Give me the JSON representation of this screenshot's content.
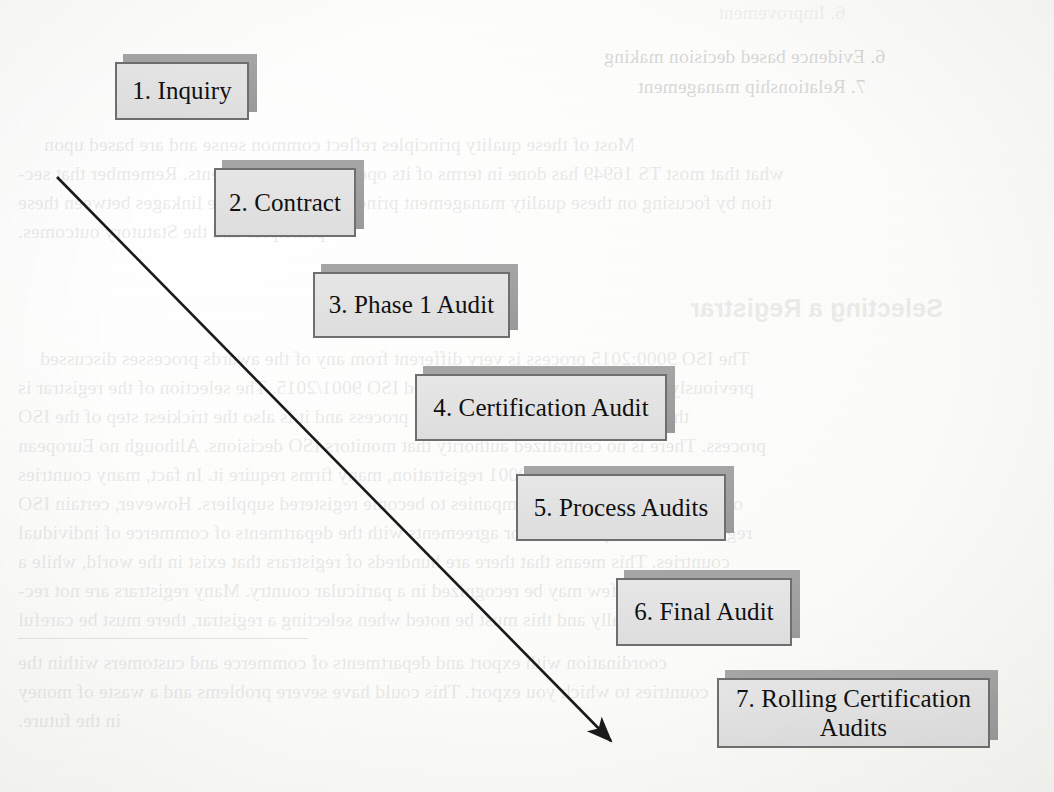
{
  "page": {
    "kind": "scanned-book-page-diagram",
    "background_color": "#fdfdfb",
    "box_fill": "#e3e3e3",
    "box_border": "#6f6f6f",
    "box_shadow": "#9b9b9b",
    "arrow_color": "#1a1a1a"
  },
  "diagram": {
    "title": "",
    "arrow": {
      "start": {
        "x": 57,
        "y": 177
      },
      "end": {
        "x": 617,
        "y": 747
      },
      "label": "flow-arrow"
    },
    "steps": [
      {
        "num": "1",
        "label": "1. Inquiry",
        "x": 115,
        "y": 62,
        "w": 134,
        "h": 58,
        "font": 25
      },
      {
        "num": "2",
        "label": "2. Contract",
        "x": 214,
        "y": 168,
        "w": 142,
        "h": 69,
        "font": 25
      },
      {
        "num": "3",
        "label": "3. Phase 1 Audit",
        "x": 313,
        "y": 272,
        "w": 197,
        "h": 66,
        "font": 25
      },
      {
        "num": "4",
        "label": "4. Certification Audit",
        "x": 415,
        "y": 374,
        "w": 252,
        "h": 67,
        "font": 25
      },
      {
        "num": "5",
        "label": "5. Process Audits",
        "x": 516,
        "y": 474,
        "w": 210,
        "h": 67,
        "font": 25
      },
      {
        "num": "6",
        "label": "6. Final Audit",
        "x": 616,
        "y": 578,
        "w": 176,
        "h": 68,
        "font": 25
      },
      {
        "num": "7",
        "label": "7. Rolling Certification\nAudits",
        "x": 717,
        "y": 678,
        "w": 273,
        "h": 70,
        "font": 25
      }
    ]
  },
  "showthrough": {
    "note": "Faint mirrored text bleeding through from the reverse side of the page.",
    "heading": "Selecting a Registrar",
    "bullets": [
      "6. Improvement",
      "6. Evidence based decision making",
      "7. Relationship management"
    ],
    "paragraphs": [
      [
        "Most of these quality principles reflect common sense and are based upon",
        "what that most TS 16949 has done in terms of its operational requirements. Remember that sec-",
        "tion by focusing on these quality management principles as well as the linkages between these",
        "principles and the Statutory outcomes."
      ],
      [
        "The ISO 9000:2015 process is very different from any of the awards processes discussed",
        "previously, as many who have implemented ISO 9001/2015. The selection of the registrar is",
        "the most important step in the ISO process and it is also the trickiest step of the ISO",
        "process. There is no centralized authority that monitors ISO decisions. Although no European",
        "country requires ISO 9001 registration, many firms require it. In fact, many countries",
        "officially encourage their companies to become registered suppliers. However, certain ISO",
        "registrars have requirements or agreements with the departments of commerce of individual",
        "countries. This means that there are hundreds of registrars that exist in the world, while a",
        "relative few may be recognized in a particular country. Many registrars are not rec-",
        "ognized officially and this must be noted when selecting a registrar, there must be careful",
        "coordination with export and departments of commerce and customers within the",
        "countries to which you export. This could have severe problems and a waste of money",
        "in the future."
      ]
    ],
    "trailing": "The should work with export and departments of commerce and customers within the"
  }
}
